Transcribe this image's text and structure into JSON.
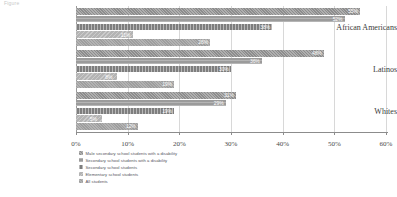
{
  "figure": {
    "caption": "Figure"
  },
  "chart_data": {
    "type": "bar",
    "orientation": "horizontal",
    "title": "",
    "xlabel": "",
    "ylabel": "",
    "xlim": [
      0,
      60
    ],
    "xticks": [
      "0%",
      "10%",
      "20%",
      "30%",
      "40%",
      "50%",
      "60%"
    ],
    "xtick_values": [
      0,
      10,
      20,
      30,
      40,
      50,
      60
    ],
    "grid": true,
    "legend_position": "bottom-left",
    "categories": [
      "African Americans",
      "Latinos",
      "Whites"
    ],
    "series": [
      {
        "name": "Male secondary school students with a disability",
        "color": "#8d8d8d",
        "values": [
          55,
          48,
          31
        ],
        "labels": [
          "55%",
          "48%",
          "31%"
        ]
      },
      {
        "name": "Secondary school students with a disability",
        "color": "#9b9b9b",
        "values": [
          52,
          36,
          29
        ],
        "labels": [
          "52%",
          "36%",
          "29%"
        ]
      },
      {
        "name": "Secondary school students",
        "color": "#7e7e7e",
        "values": [
          38,
          30,
          19
        ],
        "labels": [
          "38%",
          "30%",
          "19%"
        ]
      },
      {
        "name": "Elementary school students",
        "color": "#b4b4b4",
        "values": [
          11,
          8,
          5
        ],
        "labels": [
          "11%",
          "8%",
          "5%"
        ]
      },
      {
        "name": "All students",
        "color": "#9e9e9e",
        "values": [
          26,
          19,
          12
        ],
        "labels": [
          "26%",
          "19%",
          "12%"
        ]
      }
    ]
  }
}
